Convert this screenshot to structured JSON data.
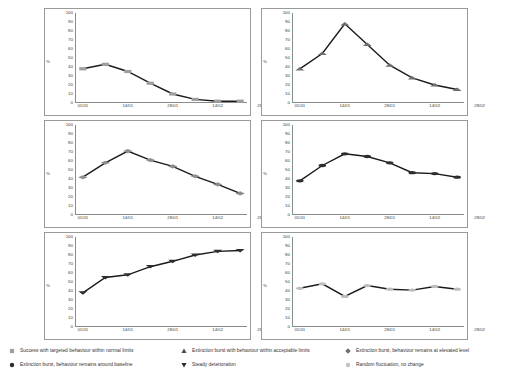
{
  "axes": {
    "y_label": "%",
    "y_ticks": [
      100,
      90,
      80,
      70,
      60,
      50,
      40,
      30,
      20,
      10,
      0
    ],
    "y_min": 0,
    "y_max": 100,
    "x_ticks": [
      "01/01",
      "14/01",
      "28/01",
      "14/02",
      "28/02"
    ]
  },
  "colors": {
    "line": "#1a1a1a",
    "frame": "#9a9a9a",
    "axis": "#8a8a8a",
    "marker_gray": "#9e9e9e",
    "marker_dark": "#2d2d2d",
    "marker_light": "#c9c9c9",
    "text": "#333333"
  },
  "chart_data": [
    {
      "type": "line",
      "name": "success-within-normal-limits",
      "marker": "square",
      "marker_color": "#9e9e9e",
      "title": "",
      "xlabel": "",
      "ylabel": "%",
      "ylim": [
        0,
        100
      ],
      "grid": false,
      "legend": "none",
      "categories": [
        "01/01",
        "07/01",
        "14/01",
        "21/01",
        "28/01",
        "07/02",
        "14/02",
        "21/02",
        "28/02",
        "07/03"
      ],
      "x": [
        0,
        14,
        28,
        42,
        56,
        70,
        84,
        98
      ],
      "xtick_labels": [
        "01/01",
        "14/01",
        "28/01",
        "14/02",
        "28/02"
      ],
      "values": [
        38,
        43,
        35,
        22,
        10,
        4,
        2,
        2
      ]
    },
    {
      "type": "line",
      "name": "extinction-burst-acceptable-limits",
      "marker": "triangle-up",
      "marker_color": "#6e6e6e",
      "title": "",
      "xlabel": "",
      "ylabel": "%",
      "ylim": [
        0,
        100
      ],
      "grid": false,
      "legend": "none",
      "x": [
        0,
        14,
        28,
        42,
        56,
        70,
        84,
        98
      ],
      "xtick_labels": [
        "01/01",
        "14/01",
        "28/01",
        "14/02",
        "28/02"
      ],
      "values": [
        38,
        55,
        88,
        65,
        42,
        28,
        20,
        15
      ]
    },
    {
      "type": "line",
      "name": "extinction-burst-elevated-level",
      "marker": "diamond",
      "marker_color": "#8d8d8d",
      "title": "",
      "xlabel": "",
      "ylabel": "%",
      "ylim": [
        0,
        100
      ],
      "grid": false,
      "legend": "none",
      "x": [
        0,
        14,
        28,
        42,
        56,
        70,
        84,
        98
      ],
      "xtick_labels": [
        "01/01",
        "14/01",
        "28/01",
        "14/02",
        "28/02"
      ],
      "values": [
        42,
        58,
        71,
        61,
        54,
        43,
        34,
        24
      ]
    },
    {
      "type": "line",
      "name": "extinction-burst-around-baseline",
      "marker": "circle",
      "marker_color": "#2d2d2d",
      "title": "",
      "xlabel": "",
      "ylabel": "%",
      "ylim": [
        0,
        100
      ],
      "grid": false,
      "legend": "none",
      "x": [
        0,
        14,
        28,
        42,
        56,
        70,
        84,
        98
      ],
      "xtick_labels": [
        "01/01",
        "14/01",
        "28/01",
        "14/02",
        "28/02"
      ],
      "values": [
        38,
        55,
        68,
        65,
        58,
        47,
        46,
        42
      ]
    },
    {
      "type": "line",
      "name": "steady-deterioration",
      "marker": "triangle-down",
      "marker_color": "#2d2d2d",
      "title": "",
      "xlabel": "",
      "ylabel": "%",
      "ylim": [
        0,
        100
      ],
      "grid": false,
      "legend": "none",
      "x": [
        0,
        14,
        28,
        42,
        56,
        70,
        84,
        98
      ],
      "xtick_labels": [
        "01/01",
        "14/01",
        "28/01",
        "14/02",
        "28/02"
      ],
      "values": [
        38,
        55,
        58,
        67,
        73,
        80,
        84,
        85
      ]
    },
    {
      "type": "line",
      "name": "random-fluctuation-no-change",
      "marker": "circle-light",
      "marker_color": "#bdbdbd",
      "title": "",
      "xlabel": "",
      "ylabel": "%",
      "ylim": [
        0,
        100
      ],
      "grid": false,
      "legend": "none",
      "x": [
        0,
        14,
        28,
        42,
        56,
        70,
        84,
        98
      ],
      "xtick_labels": [
        "01/01",
        "14/01",
        "28/01",
        "14/02",
        "28/02"
      ],
      "values": [
        43,
        48,
        34,
        46,
        42,
        41,
        45,
        42
      ]
    }
  ],
  "legend": {
    "items": [
      {
        "marker": "square",
        "marker_color": "#9e9e9e",
        "label": "Success with targeted behaviour within normal limits"
      },
      {
        "marker": "triangle-up",
        "marker_color": "#4a4a4a",
        "label": "Extinction burst with behaviour within acceptable limits"
      },
      {
        "marker": "diamond",
        "marker_color": "#6e6e6e",
        "label": "Extinction burst, behaviour remains at elevated level"
      },
      {
        "marker": "circle",
        "marker_color": "#2d2d2d",
        "label": "Extinction burst, behaviour remains around baseline"
      },
      {
        "marker": "triangle-down",
        "marker_color": "#2d2d2d",
        "label": "Steady deterioration"
      },
      {
        "marker": "circle-light",
        "marker_color": "#c2c2c2",
        "label": "Random fluctuation, no change"
      }
    ]
  }
}
